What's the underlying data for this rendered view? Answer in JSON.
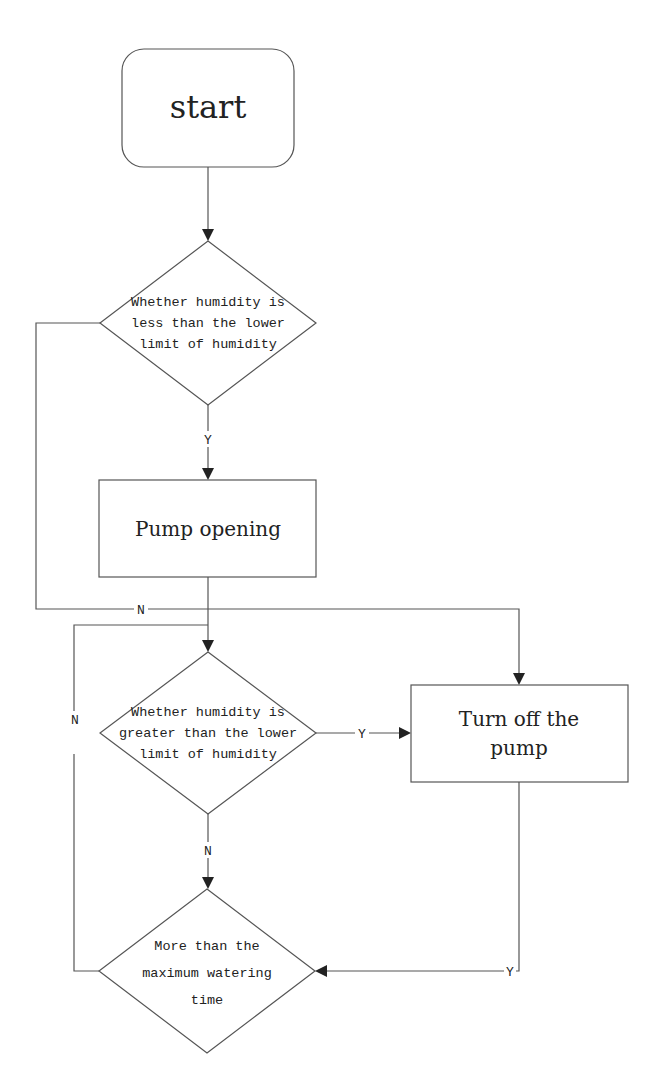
{
  "diagram": {
    "type": "flowchart",
    "nodes": {
      "start": {
        "label": "start",
        "shape": "rounded-rect"
      },
      "decision1": {
        "label_lines": [
          "Whether humidity is",
          "less than the lower",
          "limit of humidity"
        ],
        "shape": "diamond"
      },
      "pump_open": {
        "label": "Pump opening",
        "shape": "rect"
      },
      "decision2": {
        "label_lines": [
          "Whether humidity is",
          "greater than the lower",
          "limit of humidity"
        ],
        "shape": "diamond"
      },
      "pump_off": {
        "label_lines": [
          "Turn off the",
          "pump"
        ],
        "shape": "rect"
      },
      "decision3": {
        "label_lines": [
          "More than the",
          "maximum watering",
          "time"
        ],
        "shape": "diamond"
      }
    },
    "edge_labels": {
      "d1_yes": "Y",
      "d1_no": "N",
      "d2_yes": "Y",
      "d2_no": "N",
      "d3_no": "N",
      "off_to_d3": "Y"
    },
    "edges": [
      {
        "from": "start",
        "to": "decision1",
        "label": ""
      },
      {
        "from": "decision1",
        "to": "pump_open",
        "label": "Y"
      },
      {
        "from": "decision1",
        "to": "pump_off",
        "label": "N"
      },
      {
        "from": "pump_open",
        "to": "decision2",
        "label": ""
      },
      {
        "from": "decision2",
        "to": "pump_off",
        "label": "Y"
      },
      {
        "from": "decision2",
        "to": "decision3",
        "label": "N"
      },
      {
        "from": "decision3",
        "to": "decision2",
        "label": "N"
      },
      {
        "from": "pump_off",
        "to": "decision3",
        "label": "Y"
      }
    ],
    "colors": {
      "stroke": "#555555",
      "text": "#222222",
      "background": "#ffffff"
    }
  }
}
